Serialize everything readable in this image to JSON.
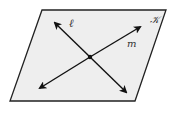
{
  "diagram": {
    "plane": {
      "label": "𝒦",
      "fill": "#eeeeee",
      "stroke": "#222222"
    },
    "lines": [
      {
        "name": "line-l",
        "label": "ℓ"
      },
      {
        "name": "line-m",
        "label": "m"
      }
    ],
    "intersection_point": "unlabeled"
  }
}
